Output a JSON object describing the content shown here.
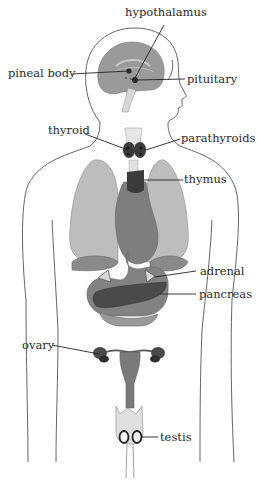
{
  "diagram": {
    "labels": {
      "hypothalamus": "hypothalamus",
      "pineal_body": "pineal body",
      "pituitary": "pituitary",
      "thyroid": "thyroid",
      "parathyroids": "parathyroids",
      "thymus": "thymus",
      "adrenal": "adrenal",
      "pancreas": "pancreas",
      "ovary": "ovary",
      "testis": "testis"
    },
    "colors": {
      "outline": "#555555",
      "brain": "#9a9a9a",
      "lung": "#bdbdbd",
      "organ_dark": "#7e7e7e",
      "gland": "#3a3a3a",
      "leader_line": "#222222"
    }
  }
}
